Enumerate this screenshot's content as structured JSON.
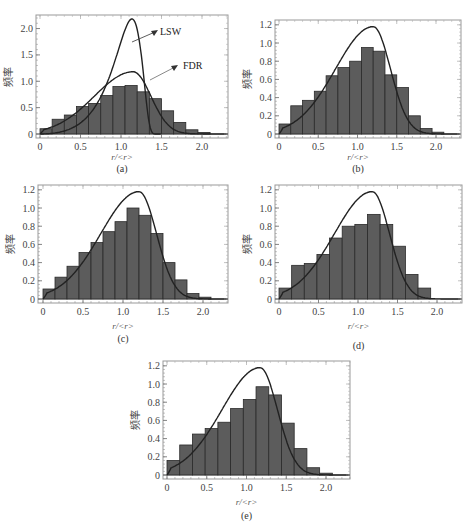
{
  "figure": {
    "ylabel": "频率",
    "xlabel": "r/<r>",
    "bar_fill": "#5c5c5c",
    "bar_stroke": "#2a2a2a",
    "curve_color": "#222222",
    "frame_color": "#999999"
  },
  "chart_data": [
    {
      "type": "bar",
      "caption": "(a)",
      "title": "",
      "xlabel": "r/<r>",
      "ylabel": "频率",
      "xlim": [
        0,
        2.3
      ],
      "ylim": [
        0,
        2.2
      ],
      "xticks": [
        "0",
        "0.5",
        "1.0",
        "1.5",
        "2.0"
      ],
      "yticks": [
        "0",
        "0.5",
        "1.0",
        "1.5",
        "2.0"
      ],
      "bin_width": 0.15,
      "bin_starts": [
        0.0,
        0.15,
        0.3,
        0.45,
        0.6,
        0.75,
        0.9,
        1.05,
        1.2,
        1.35,
        1.5,
        1.65,
        1.8,
        1.95
      ],
      "values": [
        0.1,
        0.28,
        0.36,
        0.52,
        0.58,
        0.73,
        0.9,
        0.92,
        0.8,
        0.67,
        0.44,
        0.22,
        0.08,
        0.03
      ],
      "curves": [
        {
          "name": "LSW",
          "peak_x": 1.13,
          "peak_y": 2.15
        },
        {
          "name": "FDR",
          "peak_x": 1.15,
          "peak_y": 1.18
        }
      ],
      "annotations": [
        "LSW",
        "FDR"
      ]
    },
    {
      "type": "bar",
      "caption": "(b)",
      "title": "",
      "xlabel": "r/<r>",
      "ylabel": "频率",
      "xlim": [
        0,
        2.3
      ],
      "ylim": [
        0,
        1.22
      ],
      "xticks": [
        "0",
        "0.5",
        "1.0",
        "1.5",
        "2.0"
      ],
      "yticks": [
        "0",
        "0.2",
        "0.4",
        "0.6",
        "0.8",
        "1.0",
        "1.2"
      ],
      "bin_width": 0.15,
      "bin_starts": [
        0.0,
        0.15,
        0.3,
        0.45,
        0.6,
        0.75,
        0.9,
        1.05,
        1.2,
        1.35,
        1.5,
        1.65,
        1.8,
        1.95
      ],
      "values": [
        0.11,
        0.31,
        0.37,
        0.47,
        0.64,
        0.73,
        0.8,
        0.95,
        0.91,
        0.65,
        0.51,
        0.2,
        0.06,
        0.02
      ],
      "curves": [
        {
          "name": "FDR",
          "peak_x": 1.2,
          "peak_y": 1.18
        }
      ]
    },
    {
      "type": "bar",
      "caption": "(c)",
      "title": "",
      "xlabel": "r/<r>",
      "ylabel": "频率",
      "xlim": [
        0,
        2.3
      ],
      "ylim": [
        0,
        1.22
      ],
      "xticks": [
        "0",
        "0.5",
        "1.0",
        "1.5",
        "2.0"
      ],
      "yticks": [
        "0",
        "0.2",
        "0.4",
        "0.6",
        "0.8",
        "1.0",
        "1.2"
      ],
      "bin_width": 0.15,
      "bin_starts": [
        0.0,
        0.15,
        0.3,
        0.45,
        0.6,
        0.75,
        0.9,
        1.05,
        1.2,
        1.35,
        1.5,
        1.65,
        1.8,
        1.95
      ],
      "values": [
        0.11,
        0.24,
        0.36,
        0.51,
        0.62,
        0.74,
        0.85,
        1.0,
        0.92,
        0.72,
        0.4,
        0.21,
        0.06,
        0.02
      ],
      "curves": [
        {
          "name": "FDR",
          "peak_x": 1.2,
          "peak_y": 1.18
        }
      ]
    },
    {
      "type": "bar",
      "caption": "(d)",
      "title": "",
      "xlabel": "r/<r>",
      "ylabel": "频率",
      "xlim": [
        0,
        2.3
      ],
      "ylim": [
        0,
        1.22
      ],
      "xticks": [
        "0",
        "0.5",
        "1.0",
        "1.5",
        "2.0"
      ],
      "yticks": [
        "0",
        "0.2",
        "0.4",
        "0.6",
        "0.8",
        "1.0",
        "1.2"
      ],
      "bin_width": 0.16,
      "bin_starts": [
        0.0,
        0.16,
        0.32,
        0.48,
        0.64,
        0.8,
        0.96,
        1.12,
        1.28,
        1.44,
        1.6,
        1.76
      ],
      "values": [
        0.12,
        0.37,
        0.39,
        0.49,
        0.67,
        0.8,
        0.82,
        0.93,
        0.82,
        0.58,
        0.27,
        0.12
      ],
      "curves": [
        {
          "name": "FDR",
          "peak_x": 1.18,
          "peak_y": 1.18
        }
      ]
    },
    {
      "type": "bar",
      "caption": "(e)",
      "title": "",
      "xlabel": "r/<r>",
      "ylabel": "频率",
      "xlim": [
        0,
        2.3
      ],
      "ylim": [
        0,
        1.22
      ],
      "xticks": [
        "0",
        "0.5",
        "1.0",
        "1.5",
        "2.0"
      ],
      "yticks": [
        "0",
        "0.2",
        "0.4",
        "0.6",
        "0.8",
        "1.0",
        "1.2"
      ],
      "bin_width": 0.16,
      "bin_starts": [
        0.0,
        0.16,
        0.32,
        0.48,
        0.64,
        0.8,
        0.96,
        1.12,
        1.28,
        1.44,
        1.6,
        1.76,
        1.92
      ],
      "values": [
        0.16,
        0.33,
        0.45,
        0.51,
        0.58,
        0.73,
        0.83,
        0.97,
        0.88,
        0.57,
        0.29,
        0.08,
        0.02
      ],
      "curves": [
        {
          "name": "FDR",
          "peak_x": 1.17,
          "peak_y": 1.18
        }
      ]
    }
  ],
  "layout": [
    {
      "frame": [
        36,
        15,
        228,
        138
      ],
      "x0": 40,
      "xscale": 81,
      "caption_y": 172,
      "xlabel_y": 160
    },
    {
      "frame": [
        275,
        20,
        461,
        138
      ],
      "x0": 279,
      "xscale": 78.5,
      "caption_y": 172,
      "xlabel_y": 160
    },
    {
      "frame": [
        38,
        185,
        228,
        303
      ],
      "x0": 43,
      "xscale": 80,
      "caption_y": 342,
      "xlabel_y": 329
    },
    {
      "frame": [
        275,
        185,
        462,
        303
      ],
      "x0": 279,
      "xscale": 79,
      "caption_y": 349,
      "xlabel_y": 329
    },
    {
      "frame": [
        163,
        361,
        350,
        479
      ],
      "x0": 167,
      "xscale": 79.5,
      "caption_y": 519,
      "xlabel_y": 505
    }
  ]
}
